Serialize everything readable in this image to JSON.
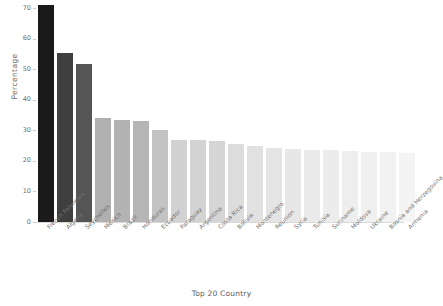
{
  "chart_data": {
    "type": "bar",
    "title": "",
    "xlabel": "Top 20 Country",
    "ylabel": "Percentage",
    "ylim": [
      0,
      70
    ],
    "yticks": [
      0,
      10,
      20,
      30,
      40,
      50,
      60,
      70
    ],
    "grid": false,
    "legend": false,
    "categories": [
      "French Polynesia",
      "Algeria",
      "Seychelles",
      "Mexico",
      "Brazil",
      "Honduras",
      "Ecuador",
      "Paraguay",
      "Argentina",
      "Costa Rica",
      "Bolivia",
      "Montenegro",
      "Reunion",
      "Syria",
      "Tunisia",
      "Suriname",
      "Moldova",
      "Ukraine",
      "Bosnia and Herzegovina",
      "Armenia"
    ],
    "values": [
      71.0,
      55.2,
      51.8,
      34.0,
      33.4,
      33.2,
      30.2,
      26.9,
      26.8,
      26.5,
      25.6,
      24.8,
      24.3,
      23.9,
      23.6,
      23.4,
      23.2,
      23.0,
      22.8,
      22.6
    ],
    "bar_colors": [
      "#1a1a1a",
      "#3f3f3f",
      "#555555",
      "#b0b0b0",
      "#b3b3b3",
      "#b5b5b5",
      "#c3c3c3",
      "#d2d2d2",
      "#d3d3d3",
      "#d5d5d5",
      "#dcdcdc",
      "#e1e1e1",
      "#e4e4e4",
      "#e7e7e7",
      "#eaeaea",
      "#ececec",
      "#eeeeee",
      "#f0f0f0",
      "#f2f2f2",
      "#f4f4f4"
    ]
  }
}
